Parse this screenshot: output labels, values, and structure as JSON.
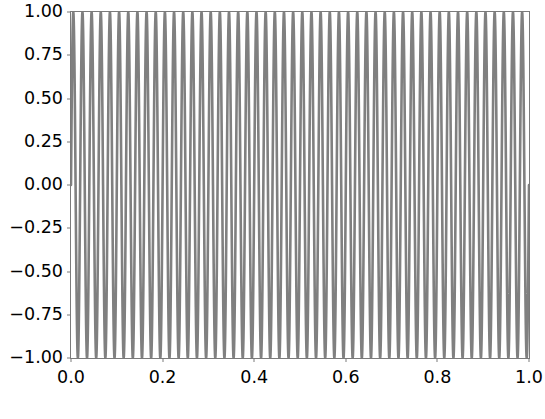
{
  "chart_data": {
    "type": "line",
    "title": "",
    "xlabel": "",
    "ylabel": "",
    "xlim": [
      0.0,
      1.0
    ],
    "ylim": [
      -1.0,
      1.0
    ],
    "grid": false,
    "legend": null,
    "line_color": "#808080",
    "line_width": 1.0,
    "background_color": "#ffffff",
    "frame_color": "#7a7a7a",
    "xticks": [
      0.0,
      0.2,
      0.4,
      0.6,
      0.8,
      1.0
    ],
    "xticklabels": [
      "0.0",
      "0.2",
      "0.4",
      "0.6",
      "0.8",
      "1.0"
    ],
    "yticks": [
      1.0,
      0.75,
      0.5,
      0.25,
      0.0,
      -0.25,
      -0.5,
      -0.75,
      -1.0
    ],
    "yticklabels": [
      "1.00",
      "0.75",
      "0.50",
      "0.25",
      "0.00",
      "−0.25",
      "−0.50",
      "−0.75",
      "−1.00"
    ],
    "series": [
      {
        "name": "sine",
        "function": "sin",
        "amplitude": 1.0,
        "cycles": 50,
        "phase": 0.0,
        "x_start": 0.0,
        "x_end": 1.0,
        "n_points": 2000
      }
    ]
  }
}
